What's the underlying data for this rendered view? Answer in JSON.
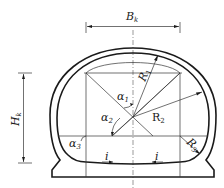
{
  "figure": {
    "type": "tunnel cross-section (horseshoe) with inverted arch",
    "labels": {
      "width": {
        "main": "B",
        "sub": "k"
      },
      "height": {
        "main": "H",
        "sub": "k"
      },
      "R1": {
        "main": "R",
        "sub": "1"
      },
      "R2": {
        "main": "R",
        "sub": "2"
      },
      "R3": {
        "main": "R",
        "sub": "3"
      },
      "alpha1": {
        "main": "α",
        "sub": "1"
      },
      "alpha2": {
        "main": "α",
        "sub": "2"
      },
      "alpha3": {
        "main": "α",
        "sub": "3"
      },
      "slope_left": "i",
      "slope_right": "i"
    },
    "colors": {
      "line": "#1a1a1a",
      "background": "#ffffff"
    }
  }
}
